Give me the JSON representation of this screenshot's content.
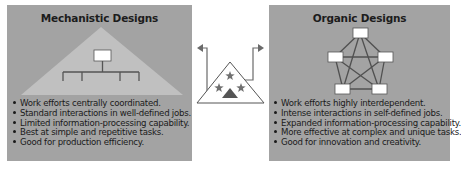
{
  "diagram": {
    "colors": {
      "panel_bg": "#a3a3a3",
      "triangle_fill": "#c0c0c0",
      "line": "#555555",
      "node_fill": "#ffffff",
      "text": "#1a1a1a",
      "icon_gray": "#707070"
    },
    "mechanistic": {
      "title": "Mechanistic Designs",
      "bullets": [
        "Work efforts centrally coordinated.",
        "Standard interactions in well-defined jobs.",
        "Limited information-processing capability.",
        "Best at simple and repetitive tasks.",
        "Good for production efficiency."
      ]
    },
    "organic": {
      "title": "Organic Designs",
      "bullets": [
        "Work efforts highly interdependent.",
        "Intense interactions in self-defined jobs.",
        "Expanded information-processing capability.",
        "More effective at complex and unique tasks.",
        "Good for innovation and creativity."
      ]
    },
    "center_icon": {
      "shape": "triangle-with-stars",
      "stars": 3,
      "arrows": [
        "left",
        "right"
      ]
    }
  }
}
